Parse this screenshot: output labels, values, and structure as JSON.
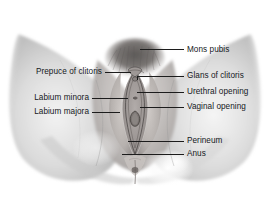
{
  "figure": {
    "kind": "anatomical-illustration",
    "rendering": "grayscale halftone drawing",
    "background_color": "#ffffff",
    "line_color": "#1c1c1c",
    "text_color": "#15181c",
    "width": 269,
    "height": 206
  },
  "labels": {
    "right": [
      {
        "id": "mons-pubis",
        "text": "Mons pubis"
      },
      {
        "id": "glans-of-clitoris",
        "text": "Glans of clitoris"
      },
      {
        "id": "urethral-opening",
        "text": "Urethral opening"
      },
      {
        "id": "vaginal-opening",
        "text": "Vaginal opening"
      },
      {
        "id": "perineum",
        "text": "Perineum"
      },
      {
        "id": "anus",
        "text": "Anus"
      }
    ],
    "left": [
      {
        "id": "prepuce-of-clitoris",
        "text": "Prepuce of clitoris"
      },
      {
        "id": "labium-minora",
        "text": "Labium minora"
      },
      {
        "id": "labium-majora",
        "text": "Labium majora"
      }
    ]
  }
}
